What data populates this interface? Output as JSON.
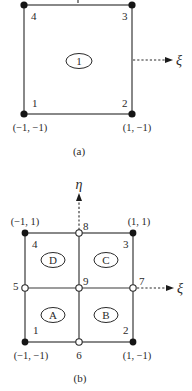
{
  "figure_a": {
    "caption": "(a)",
    "element_label": "1",
    "xi_axis_label": "ξ",
    "nodes": [
      {
        "id": "1",
        "label": "1",
        "type": "corner"
      },
      {
        "id": "2",
        "label": "2",
        "type": "corner"
      },
      {
        "id": "3",
        "label": "3",
        "type": "corner"
      },
      {
        "id": "4",
        "label": "4",
        "type": "corner"
      }
    ],
    "coordinates": {
      "bottom_left": "(−1, −1)",
      "bottom_right": "(1, −1)"
    }
  },
  "figure_b": {
    "caption": "(b)",
    "eta_axis_label": "η",
    "xi_axis_label": "ξ",
    "subelements": {
      "A": "A",
      "B": "B",
      "C": "C",
      "D": "D"
    },
    "nodes": [
      {
        "id": "1",
        "label": "1",
        "type": "corner"
      },
      {
        "id": "2",
        "label": "2",
        "type": "corner"
      },
      {
        "id": "3",
        "label": "3",
        "type": "corner"
      },
      {
        "id": "4",
        "label": "4",
        "type": "corner"
      },
      {
        "id": "5",
        "label": "5",
        "type": "midside"
      },
      {
        "id": "6",
        "label": "6",
        "type": "midside"
      },
      {
        "id": "7",
        "label": "7",
        "type": "midside"
      },
      {
        "id": "8",
        "label": "8",
        "type": "midside"
      },
      {
        "id": "9",
        "label": "9",
        "type": "center"
      }
    ],
    "coordinates": {
      "top_left": "(−1, 1)",
      "top_right": "(1, 1)",
      "bottom_left": "(−1, −1)",
      "bottom_right": "(1, −1)"
    }
  }
}
